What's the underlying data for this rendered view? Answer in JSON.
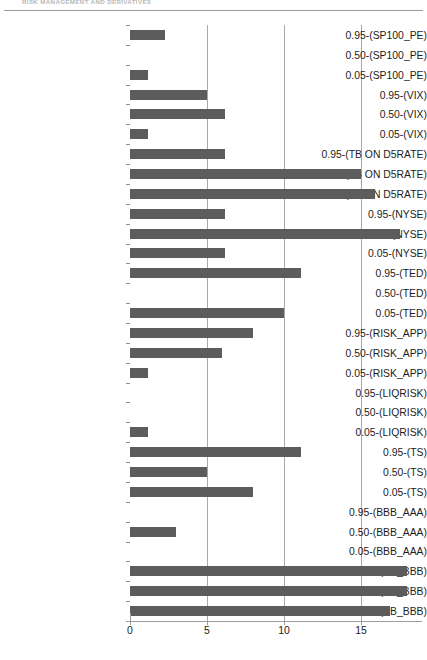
{
  "page": {
    "running_head": "RISK MANAGEMENT AND DERIVATIVES",
    "bottom_caption": ""
  },
  "chart_data": {
    "type": "bar",
    "orientation": "horizontal",
    "title": "",
    "xlabel": "",
    "ylabel": "",
    "xlim": [
      0,
      19
    ],
    "xticks": [
      0,
      5,
      10,
      15
    ],
    "xtick_labels": [
      "0",
      "5",
      "10",
      "15"
    ],
    "grid": true,
    "grid_axis": "x",
    "legend": null,
    "bar_color": "#5c5c5c",
    "axis_color": "#9d9d9d",
    "gridline_color": "#a8a8a8",
    "categories": [
      "0.95-(SP100_PE)",
      "0.50-(SP100_PE)",
      "0.05-(SP100_PE)",
      "0.95-(VIX)",
      "0.50-(VIX)",
      "0.05-(VIX)",
      "0.95-(TB ON D5RATE)",
      "0.50-(TB ON D5RATE)",
      "0.05-(TB ON D5RATE)",
      "0.95-(NYSE)",
      "0.50-(NYSE)",
      "0.05-(NYSE)",
      "0.95-(TED)",
      "0.50-(TED)",
      "0.05-(TED)",
      "0.95-(RISK_APP)",
      "0.50-(RISK_APP)",
      "0.05-(RISK_APP)",
      "0.95-(LIQRISK)",
      "0.50-(LIQRISK)",
      "0.05-(LIQRISK)",
      "0.95-(TS)",
      "0.50-(TS)",
      "0.05-(TS)",
      "0.95-(BBB_AAA)",
      "0.50-(BBB_AAA)",
      "0.05-(BBB_AAA)",
      "0.95-(BB_BBB)",
      "0.50-(BB_BBB)",
      "0.05-(BB_BBB)"
    ],
    "values": [
      2.3,
      0,
      1.2,
      5.0,
      6.2,
      1.2,
      6.2,
      15.0,
      15.9,
      6.2,
      17.5,
      6.2,
      11.1,
      0,
      10.0,
      8.0,
      6.0,
      1.2,
      0,
      0,
      1.2,
      11.1,
      5.0,
      8.0,
      0,
      3.0,
      0,
      18.0,
      18.0,
      16.9
    ]
  }
}
